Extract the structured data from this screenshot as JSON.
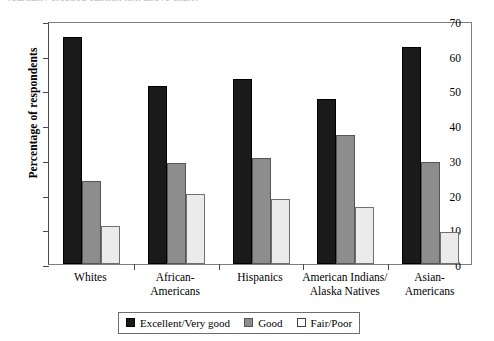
{
  "caption_remnant": "(partially cropped caption text above chart)",
  "chart_data": {
    "type": "bar",
    "title": "",
    "xlabel": "",
    "ylabel": "Percentage of respondents",
    "ylim": [
      0,
      70
    ],
    "yticks": [
      0,
      10,
      20,
      30,
      40,
      50,
      60,
      70
    ],
    "grid": false,
    "legend_position": "bottom",
    "categories": [
      "Whites",
      "African-\nAmericans",
      "Hispanics",
      "American Indians/\nAlaska Natives",
      "Asian-\nAmericans"
    ],
    "category_lines": [
      [
        "Whites"
      ],
      [
        "African-",
        "Americans"
      ],
      [
        "Hispanics"
      ],
      [
        "American Indians/",
        "Alaska Natives"
      ],
      [
        "Asian-",
        "Americans"
      ]
    ],
    "series": [
      {
        "name": "Excellent/Very good",
        "color": "#1a1a1a",
        "values": [
          65.5,
          51.3,
          53.2,
          47.5,
          62.5
        ]
      },
      {
        "name": "Good",
        "color": "#8d8d8d",
        "values": [
          23.8,
          29.2,
          30.4,
          37.1,
          29.3
        ]
      },
      {
        "name": "Fair/Poor",
        "color": "#ebebeb",
        "values": [
          10.9,
          20.3,
          18.6,
          16.5,
          9.3
        ]
      }
    ]
  }
}
